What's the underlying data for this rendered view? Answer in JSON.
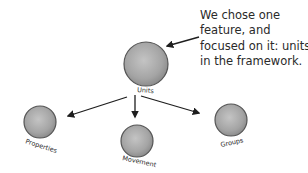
{
  "annotation": {
    "lines": [
      "We chose one",
      "feature, and",
      "focused on it: units",
      "in the framework."
    ]
  },
  "nodes": {
    "root": {
      "label": "Units"
    },
    "children": [
      {
        "label": "Properties"
      },
      {
        "label": "Movement"
      },
      {
        "label": "Groups"
      }
    ]
  },
  "colors": {
    "node_fill": "#a8a8a8",
    "node_stroke": "#555555",
    "ink": "#1e1e1e"
  }
}
